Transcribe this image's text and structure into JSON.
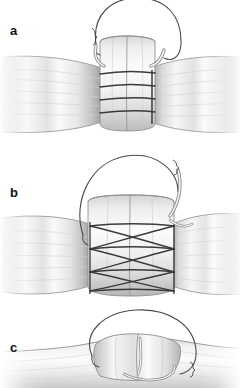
{
  "figure": {
    "background_color": "#ffffff",
    "width": 241,
    "height": 388,
    "panel_count": 3
  },
  "palette": {
    "background": "#ffffff",
    "tendon_light": "#f4f4f4",
    "tendon_mid": "#e2e2e2",
    "tendon_shadow": "#b9b9b9",
    "tendon_dark": "#9a9a9a",
    "outline": "#6e6e6e",
    "suture_line": "#3a3a3a",
    "suture_thread": "#555555",
    "label_color": "#111111"
  },
  "panels": [
    {
      "id": "panel-a",
      "label": "a",
      "label_x": 10,
      "label_y": 24,
      "caption": "Transverse suture bites placed across the tendon stumps with a looped suture strand rising above the repair",
      "top": 0,
      "height": 140,
      "suture_pattern": "transverse",
      "suture_rows": 4,
      "suture_row_y": [
        74,
        87,
        100,
        113
      ],
      "suture_span_x": [
        100,
        155
      ],
      "vertical_post_x": 152,
      "loop": {
        "type": "suture-loop",
        "cx": 138,
        "cy": 42,
        "rx": 44,
        "ry": 42
      },
      "needle_left": {
        "x": 96,
        "y": 48
      },
      "needle_right": {
        "x": 160,
        "y": 50
      }
    },
    {
      "id": "panel-b",
      "label": "b",
      "label_x": 10,
      "label_y": 186,
      "caption": "Cross-stitch suture configuration forming an X-pattern lattice across the tendon repair site",
      "top": 140,
      "height": 168,
      "suture_pattern": "cross-hatch",
      "cross_rows": 3,
      "rail_y": [
        226,
        249,
        272,
        291
      ],
      "suture_span_x": [
        88,
        175
      ],
      "loop": {
        "type": "suture-loop-needle",
        "cx": 130,
        "cy": 188,
        "rx": 48,
        "ry": 42
      },
      "needle": {
        "x": 176,
        "y": 168,
        "orientation": "curved-down-right"
      }
    },
    {
      "id": "panel-c",
      "label": "c",
      "label_x": 10,
      "label_y": 341,
      "caption": "Completed repair viewed from the side with the suture loop drawn over the tendon surface",
      "top": 308,
      "height": 80,
      "suture_pattern": "lateral-view",
      "loop": {
        "type": "suture-loop-flat",
        "cx": 140,
        "cy": 372,
        "rx": 54,
        "ry": 36
      },
      "cropped_at_bottom": true
    }
  ],
  "anatomy": {
    "structure_name": "tendon",
    "left_stump_label": "proximal tendon stump",
    "right_stump_label": "distal tendon stump",
    "junction_label": "repair site"
  }
}
